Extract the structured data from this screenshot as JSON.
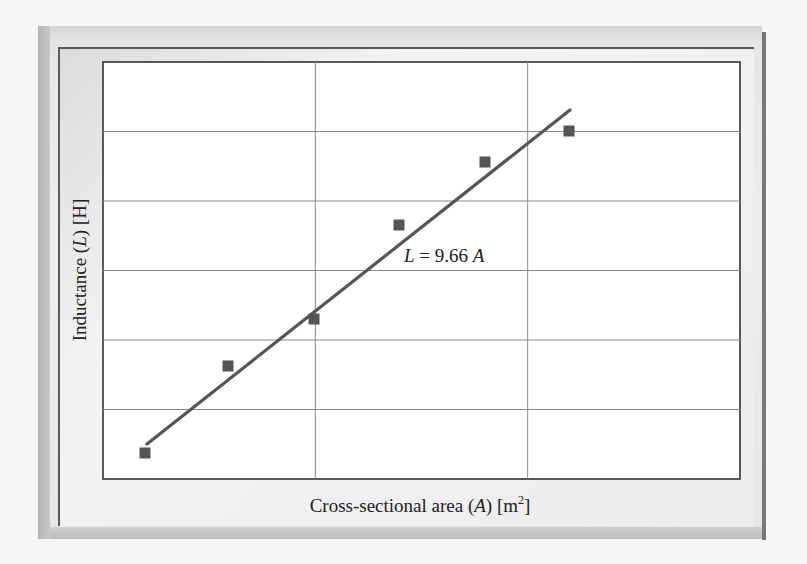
{
  "chart_data": {
    "type": "scatter",
    "title": "",
    "xlabel": "Cross-sectional area (A) [m²]",
    "ylabel": "Inductance (L) [H]",
    "xlabel_parts": {
      "prefix": "Cross-sectional area (",
      "var": "A",
      "suffix": ") [m",
      "sup": "2",
      "end": "]"
    },
    "ylabel_parts": {
      "prefix": "Inductance (",
      "var": "L",
      "suffix": ") [H]"
    },
    "tick_labels_x": [],
    "tick_labels_y": [],
    "grid": true,
    "grid_x_divisions": 3,
    "grid_y_divisions": 6,
    "series": [
      {
        "name": "Measured",
        "marker": "square",
        "color": "#555555",
        "points_px": [
          [
            145,
            453
          ],
          [
            228,
            366
          ],
          [
            314,
            319
          ],
          [
            399,
            225
          ],
          [
            485,
            162
          ],
          [
            569,
            131
          ]
        ],
        "points_relative": [
          {
            "x": 0.066,
            "y": 0.062
          },
          {
            "x": 0.196,
            "y": 0.271
          },
          {
            "x": 0.331,
            "y": 0.384
          },
          {
            "x": 0.465,
            "y": 0.609
          },
          {
            "x": 0.6,
            "y": 0.76
          },
          {
            "x": 0.732,
            "y": 0.835
          }
        ]
      },
      {
        "name": "Linear fit",
        "type": "line",
        "color": "#555555",
        "equation": "L = 9.66 A",
        "slope": 9.66,
        "endpoints_px": [
          [
            147,
            444
          ],
          [
            570,
            110
          ]
        ]
      }
    ],
    "annotation": {
      "text_var1": "L",
      "text_mid": " = 9.66 ",
      "text_var2": "A"
    },
    "legend": "none"
  },
  "colors": {
    "plot_bg": "#ffffff",
    "grid": "#888888",
    "axes": "#333333",
    "marker": "#5a5a5a",
    "line": "#5a5a5a",
    "frame": "#e6e6e6"
  }
}
